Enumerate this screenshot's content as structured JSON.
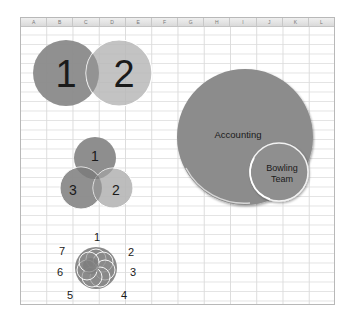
{
  "sheet": {
    "columns": [
      "A",
      "B",
      "C",
      "D",
      "E",
      "F",
      "G",
      "H",
      "I",
      "J",
      "K",
      "L"
    ]
  },
  "venn_two": {
    "labels": [
      "1",
      "2"
    ],
    "colors": [
      "#8a8a8a",
      "#b8b8b8"
    ]
  },
  "venn_three": {
    "labels": [
      "1",
      "3",
      "2"
    ],
    "colors": [
      "#8e8e8e",
      "#8a8a8a",
      "#b6b6b6"
    ]
  },
  "nested": {
    "outer_label": "Accounting",
    "inner_label_line1": "Bowling",
    "inner_label_line2": "Team",
    "colors": [
      "#8c8c8c",
      "#8f8f8f"
    ]
  },
  "flower": {
    "labels": [
      "1",
      "2",
      "3",
      "4",
      "5",
      "6",
      "7"
    ],
    "color": "#8a8a8a"
  }
}
